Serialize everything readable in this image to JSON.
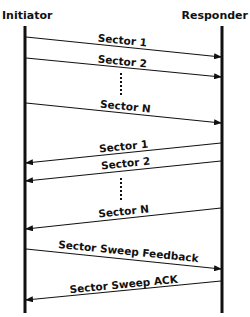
{
  "diagram": {
    "type": "sequence",
    "participants": {
      "left": "Initiator",
      "right": "Responder"
    },
    "messages": [
      {
        "label": "Sector 1",
        "direction": "right"
      },
      {
        "label": "Sector 2",
        "direction": "right"
      },
      {
        "label": "Sector N",
        "direction": "right"
      },
      {
        "label": "Sector 1",
        "direction": "left"
      },
      {
        "label": "Sector 2",
        "direction": "left"
      },
      {
        "label": "Sector N",
        "direction": "left"
      },
      {
        "label": "Sector Sweep Feedback",
        "direction": "right"
      },
      {
        "label": "Sector Sweep ACK",
        "direction": "left"
      }
    ],
    "ellipsis_marks": 2
  }
}
